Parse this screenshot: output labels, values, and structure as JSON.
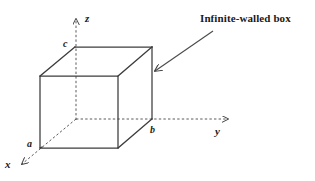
{
  "figure": {
    "title": "",
    "background_color": "#ffffff",
    "line_color": "#3a3a3a",
    "axis_color": "#555555",
    "text_color": "#1a1a1a"
  },
  "axes": {
    "x": {
      "label": "x",
      "style": "dashed",
      "arrow": "down-left"
    },
    "y": {
      "label": "y",
      "style": "dashed",
      "arrow": "right"
    },
    "z": {
      "label": "z",
      "style": "dashed",
      "arrow": "up"
    }
  },
  "vertex_labels": {
    "a": "a",
    "b": "b",
    "c": "c"
  },
  "annotation": {
    "text": "Infinite-walled box",
    "arrow": "pointer-arrow-to-box"
  }
}
